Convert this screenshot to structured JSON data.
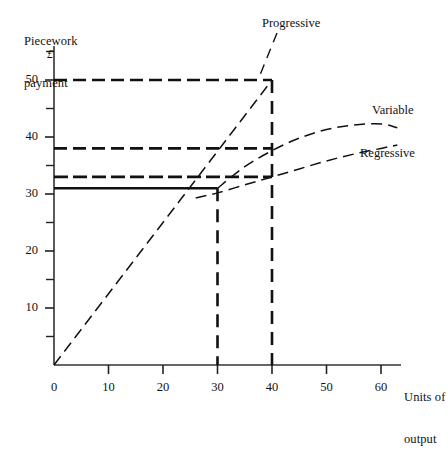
{
  "chart_data": {
    "type": "line",
    "title": "",
    "ylabel_line1": "Piecework",
    "ylabel_line2": "payment",
    "currency_symbol": "£",
    "xlabel_line1": "Units of",
    "xlabel_line2": "output",
    "xlim": [
      0,
      65
    ],
    "ylim": [
      0,
      57
    ],
    "grid": false,
    "x_major_ticks": [
      0,
      10,
      20,
      30,
      40,
      50,
      60
    ],
    "x_tick_labels": [
      "0",
      "10",
      "20",
      "30",
      "40",
      "50",
      "60"
    ],
    "y_major_ticks": [
      10,
      20,
      30,
      40,
      50
    ],
    "y_tick_labels": [
      "10",
      "20",
      "30",
      "40",
      "50"
    ],
    "y_minor_ticks": [
      5,
      15,
      25,
      35,
      45,
      55
    ],
    "series": [
      {
        "name": "Progressive",
        "label": "Progressive",
        "style": "dashed",
        "x": [
          0,
          40
        ],
        "values": [
          0,
          50
        ]
      },
      {
        "name": "Variable",
        "label": "Variable",
        "style": "dashed",
        "x": [
          30,
          35,
          40,
          45,
          50,
          55,
          60,
          63
        ],
        "values": [
          31,
          34.8,
          37.6,
          39.8,
          41.3,
          42.1,
          42.3,
          41.6
        ]
      },
      {
        "name": "Regressive",
        "label": "Regressive",
        "style": "dashed",
        "x": [
          26,
          30,
          35,
          40,
          45,
          50,
          55,
          60,
          63
        ],
        "values": [
          29.3,
          30.2,
          31.6,
          33.0,
          34.4,
          35.8,
          37.0,
          38.0,
          38.6
        ]
      },
      {
        "name": "Step level 31",
        "label": "",
        "style": "solid",
        "x": [
          0,
          30
        ],
        "values": [
          31,
          31
        ]
      },
      {
        "name": "Step level 33",
        "label": "",
        "style": "dash-dot",
        "x": [
          0,
          40
        ],
        "values": [
          33,
          33
        ]
      },
      {
        "name": "Step level 38",
        "label": "",
        "style": "dashed",
        "x": [
          0,
          40
        ],
        "values": [
          38,
          38
        ]
      },
      {
        "name": "Step level 50",
        "label": "",
        "style": "dashed",
        "x": [
          0,
          40
        ],
        "values": [
          50,
          50
        ]
      }
    ],
    "drop_lines": [
      {
        "name": "drop-at-30",
        "x": 30,
        "from": 31,
        "to": 0,
        "style": "dashed"
      },
      {
        "name": "drop-at-40",
        "x": 40,
        "from": 50,
        "to": 0,
        "style": "dashed"
      }
    ],
    "colors": {
      "ink": "#111111",
      "axis": "#333333",
      "background": "#ffffff"
    }
  }
}
